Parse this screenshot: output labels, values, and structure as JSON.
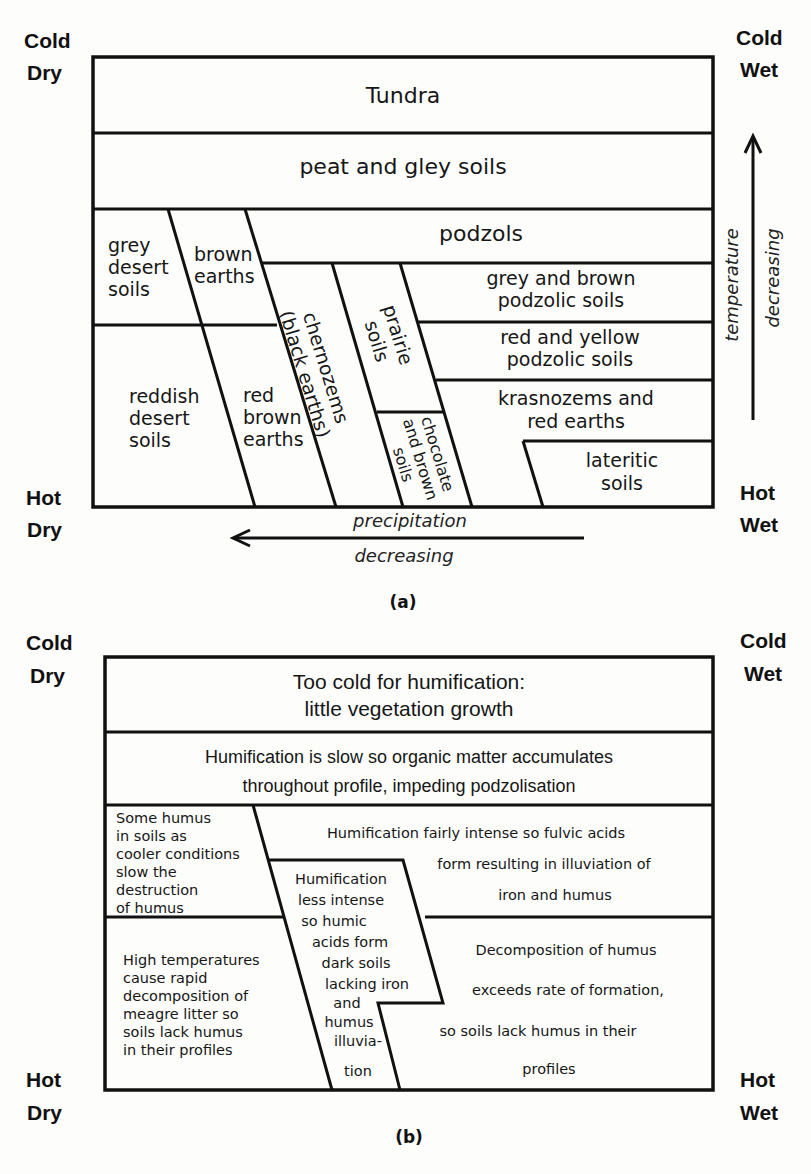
{
  "panel_a": {
    "corners": {
      "top_left": [
        "Cold",
        "Dry"
      ],
      "top_right": [
        "Cold",
        "Wet"
      ],
      "bottom_left": [
        "Hot",
        "Dry"
      ],
      "bottom_right": [
        "Hot",
        "Wet"
      ]
    },
    "zones": {
      "tundra": "Tundra",
      "peat": "peat and gley soils",
      "podzols": "podzols",
      "grey_desert": [
        "grey",
        "desert",
        "soils"
      ],
      "brown_earths": [
        "brown",
        "earths"
      ],
      "grey_brown_podzolic": [
        "grey and brown",
        "podzolic soils"
      ],
      "red_yellow_podzolic": [
        "red and yellow",
        "podzolic soils"
      ],
      "krasnozems": [
        "krasnozems and",
        "red earths"
      ],
      "lateritic": [
        "lateritic",
        "soils"
      ],
      "reddish_desert": [
        "reddish",
        "desert",
        "soils"
      ],
      "red_brown_earths": [
        "red",
        "brown",
        "earths"
      ],
      "chernozems": [
        "chernozems",
        "(black earths)"
      ],
      "prairie": [
        "prairie",
        "soils"
      ],
      "chocolate": [
        "chocolate",
        "and brown",
        "soils"
      ]
    },
    "axes": {
      "x_arrow": [
        "precipitation",
        "decreasing"
      ],
      "y_arrow": [
        "temperature",
        "decreasing"
      ]
    },
    "caption": "(a)"
  },
  "panel_b": {
    "corners": {
      "top_left": [
        "Cold",
        "Dry"
      ],
      "top_right": [
        "Cold",
        "Wet"
      ],
      "bottom_left": [
        "Hot",
        "Dry"
      ],
      "bottom_right": [
        "Hot",
        "Wet"
      ]
    },
    "zones": {
      "too_cold": [
        "Too cold for humification:",
        "little vegetation growth"
      ],
      "slow": [
        "Humification is slow so organic matter accumulates",
        "throughout  profile, impeding podzolisation"
      ],
      "some_humus": [
        "Some humus",
        "in soils as",
        "cooler conditions",
        "slow the",
        "destruction",
        "of humus"
      ],
      "fairly_intense": [
        "Humification fairly intense so  fulvic acids",
        "form resulting  in illuviation of",
        "iron and humus"
      ],
      "less_intense": [
        "Humification",
        "less intense",
        "so humic",
        "acids form",
        "dark soils",
        "lacking  iron",
        "and",
        "humus",
        "illuvia-",
        "tion"
      ],
      "high_temp": [
        "High temperatures",
        "cause rapid",
        "decomposition of",
        "meagre litter so",
        "soils lack humus",
        "in their profiles"
      ],
      "decomposition": [
        "Decomposition  of  humus",
        "exceeds rate of formation,",
        "so soils lack humus  in their",
        "profiles"
      ]
    },
    "caption": "(b)"
  }
}
